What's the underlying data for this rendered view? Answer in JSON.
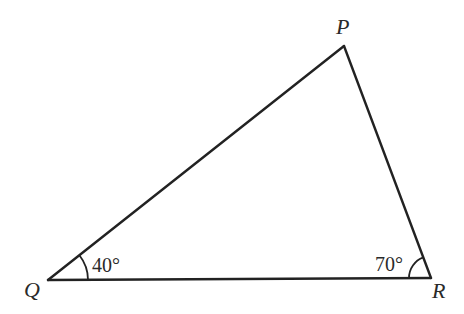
{
  "diagram": {
    "type": "triangle",
    "vertices": [
      {
        "name": "P"
      },
      {
        "name": "Q"
      },
      {
        "name": "R"
      }
    ],
    "angles": [
      {
        "vertex": "Q",
        "label": "40°",
        "degrees": 40
      },
      {
        "vertex": "R",
        "label": "70°",
        "degrees": 70
      }
    ],
    "labels": {
      "P": "P",
      "Q": "Q",
      "R": "R",
      "angle_Q": "40°",
      "angle_R": "70°"
    }
  }
}
